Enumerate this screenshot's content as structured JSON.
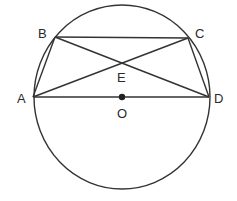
{
  "diagram": {
    "type": "geometry-circle-inscribed-quadrilateral",
    "colors": {
      "line": "#333333",
      "label": "#2a2a2a",
      "background": "#ffffff"
    },
    "circle": {
      "center_label": "O",
      "cx": 122,
      "cy": 97,
      "rx": 88,
      "ry": 92
    },
    "points": {
      "A": {
        "label": "A",
        "x": 33,
        "y": 97
      },
      "B": {
        "label": "B",
        "x": 55,
        "y": 37
      },
      "C": {
        "label": "C",
        "x": 188,
        "y": 38
      },
      "D": {
        "label": "D",
        "x": 209,
        "y": 97
      },
      "E": {
        "label": "E",
        "x": 122,
        "y": 62
      },
      "O": {
        "label": "O",
        "x": 122,
        "y": 97
      }
    },
    "segments": [
      "AB",
      "BC",
      "CD",
      "AD",
      "AC",
      "BD"
    ],
    "labels": {
      "A": "A",
      "B": "B",
      "C": "C",
      "D": "D",
      "E": "E",
      "O": "O"
    }
  }
}
